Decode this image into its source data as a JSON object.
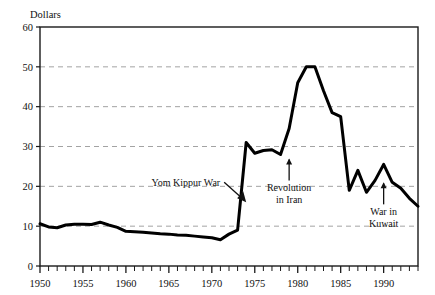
{
  "chart_data": {
    "type": "line",
    "title": "",
    "ylabel": "Dollars",
    "xlabel": "",
    "ylim": [
      0,
      60
    ],
    "xlim": [
      1950,
      1994
    ],
    "yticks": [
      0,
      10,
      20,
      30,
      40,
      50,
      60
    ],
    "ytick_labels": [
      "0",
      "10",
      "20",
      "30",
      "40",
      "50",
      "60"
    ],
    "xticks": [
      1950,
      1955,
      1960,
      1965,
      1970,
      1975,
      1980,
      1985,
      1990
    ],
    "xtick_labels": [
      "1950",
      "1955",
      "1960",
      "1965",
      "1970",
      "1975",
      "1980",
      "1985",
      "1990"
    ],
    "x_minor_tick_step": 1,
    "grid": "horizontal-dashed",
    "gridlines": [
      10,
      20,
      30,
      40,
      50
    ],
    "legend": null,
    "series": [
      {
        "name": "Crude oil price",
        "color": "#000000",
        "x": [
          1950,
          1951,
          1952,
          1953,
          1954,
          1955,
          1956,
          1957,
          1958,
          1959,
          1960,
          1961,
          1962,
          1963,
          1964,
          1965,
          1966,
          1967,
          1968,
          1969,
          1970,
          1971,
          1972,
          1973,
          1974,
          1975,
          1976,
          1977,
          1978,
          1979,
          1980,
          1981,
          1982,
          1983,
          1984,
          1985,
          1986,
          1987,
          1988,
          1989,
          1990,
          1991,
          1992,
          1993,
          1994
        ],
        "values": [
          10.6,
          9.8,
          9.6,
          10.3,
          10.5,
          10.5,
          10.4,
          11.0,
          10.3,
          9.7,
          8.7,
          8.6,
          8.5,
          8.3,
          8.1,
          8.0,
          7.8,
          7.7,
          7.5,
          7.3,
          7.1,
          6.6,
          8.0,
          9.0,
          31.0,
          28.3,
          29.0,
          29.2,
          28.0,
          34.5,
          46.0,
          50.0,
          50.0,
          44.0,
          38.5,
          37.5,
          19.0,
          24.0,
          18.5,
          21.5,
          25.5,
          21.0,
          19.5,
          17.0,
          15.0
        ]
      }
    ],
    "annotations": [
      {
        "id": "yom-kippur-war",
        "text": "Yom Kippur War",
        "lines": [
          "Yom Kippur War"
        ],
        "arrow": "diagonal-down-right",
        "points_to_year": 1974,
        "points_to_value": 16
      },
      {
        "id": "revolution-in-iran",
        "text": "Revolution in Iran",
        "lines": [
          "Revolution",
          "in Iran"
        ],
        "arrow": "up",
        "points_to_year": 1979,
        "points_to_value": 27
      },
      {
        "id": "war-in-kuwait",
        "text": "War in Kuwait",
        "lines": [
          "War in",
          "Kuwait"
        ],
        "arrow": "up",
        "points_to_year": 1990,
        "points_to_value": 21
      }
    ],
    "colors": {
      "line": "#000000",
      "axis": "#1a1a1a",
      "grid": "#999999",
      "background": "#ffffff"
    }
  }
}
